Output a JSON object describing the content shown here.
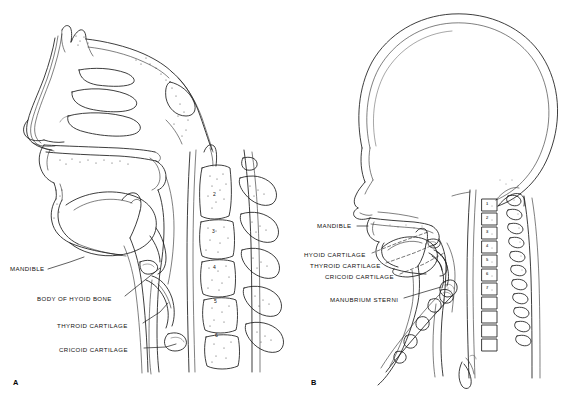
{
  "figure": {
    "background_color": "#ffffff",
    "ink_color": "#1b1b1b"
  },
  "panels": [
    {
      "id": "panel-a",
      "letter": "A",
      "letter_x": 13,
      "letter_y": 379,
      "subject": "adult-sagittal-head-and-neck",
      "labels": [
        {
          "name": "mandible",
          "text": "MANDIBLE",
          "x": 10,
          "y": 266,
          "leader": "M 48,269 L 70,262 L 84,257"
        },
        {
          "name": "body-of-hyoid-bone",
          "text": "BODY OF HYOID BONE",
          "x": 37,
          "y": 296,
          "leader": "M 125,296 L 150,276 L 160,268"
        },
        {
          "name": "thyroid-cartilage",
          "text": "THYROID CARTILAGE",
          "x": 57,
          "y": 323,
          "leader": "M 143,323 L 160,312 L 168,303"
        },
        {
          "name": "cricoid-cartilage",
          "text": "CRICOID CARTILAGE",
          "x": 59,
          "y": 347,
          "leader": "M 144,348 L 166,347 L 176,344"
        }
      ],
      "cervical_vertebrae": [
        {
          "number": "2",
          "x": 215,
          "y": 195
        },
        {
          "number": "3",
          "x": 214,
          "y": 232
        },
        {
          "number": "4",
          "x": 215,
          "y": 268
        },
        {
          "number": "5",
          "x": 216,
          "y": 302
        },
        {
          "number": "6",
          "x": 217,
          "y": 336
        }
      ]
    },
    {
      "id": "panel-b",
      "letter": "B",
      "letter_x": 311,
      "letter_y": 379,
      "subject": "infant-sagittal-head-and-neck",
      "labels": [
        {
          "name": "mandible",
          "text": "MANDIBLE",
          "x": 317,
          "y": 223,
          "leader": "M 357,226 L 368,226"
        },
        {
          "name": "hyoid-cartilage",
          "text": "HYOID CARTILAGE",
          "x": 304,
          "y": 252,
          "leader": "M 372,253 L 392,244 L 430,232"
        },
        {
          "name": "thyroid-cartilage",
          "text": "THYROID CARTILAGE",
          "x": 310,
          "y": 263,
          "leader": "M 386,263 L 412,255 L 440,243"
        },
        {
          "name": "cricoid-cartilage",
          "text": "CRICOID CARTILAGE",
          "x": 325,
          "y": 274,
          "leader": "M 400,274 L 425,264 L 447,252"
        },
        {
          "name": "manubrium-sterni",
          "text": "MANUBRIUM STERNI",
          "x": 330,
          "y": 297,
          "leader": "M 404,298 L 424,293 L 441,287"
        }
      ],
      "cervical_vertebrae": [
        {
          "number": "1",
          "x": 489,
          "y": 205
        },
        {
          "number": "2",
          "x": 489,
          "y": 219
        },
        {
          "number": "3",
          "x": 489,
          "y": 233
        },
        {
          "number": "4",
          "x": 489,
          "y": 247
        },
        {
          "number": "5",
          "x": 489,
          "y": 261
        },
        {
          "number": "6",
          "x": 489,
          "y": 275
        },
        {
          "number": "7",
          "x": 489,
          "y": 289
        }
      ]
    }
  ]
}
